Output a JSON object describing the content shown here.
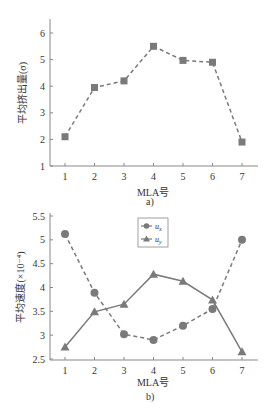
{
  "chart_data": [
    {
      "id": "a",
      "type": "line",
      "title": "",
      "caption": "a)",
      "xlabel": "MLA号",
      "ylabel": "平均挤出量(σ)",
      "categories": [
        "1",
        "2",
        "3",
        "4",
        "5",
        "6",
        "7"
      ],
      "x": [
        1,
        2,
        3,
        4,
        5,
        6,
        7
      ],
      "series": [
        {
          "name": "平均挤出量",
          "values": [
            2.1,
            3.95,
            4.2,
            5.5,
            4.97,
            4.9,
            1.9
          ],
          "marker": "square",
          "line": "dashed",
          "color": "#7a7a7a"
        }
      ],
      "ylim": [
        1,
        6.5
      ],
      "yticks": [
        1,
        2,
        3,
        4,
        5,
        6
      ],
      "ytick_labels": [
        "1",
        "2",
        "3",
        "4",
        "5",
        "6"
      ],
      "grid": false,
      "legend": null
    },
    {
      "id": "b",
      "type": "line",
      "title": "",
      "caption": "b)",
      "xlabel": "MLA号",
      "ylabel": "平均速度(×10⁻⁴)",
      "categories": [
        "1",
        "2",
        "3",
        "4",
        "5",
        "6",
        "7"
      ],
      "x": [
        1,
        2,
        3,
        4,
        5,
        6,
        7
      ],
      "series": [
        {
          "name": "ux",
          "label_main": "u",
          "label_sub": "x",
          "values": [
            5.12,
            3.89,
            3.02,
            2.9,
            3.2,
            3.55,
            5.0
          ],
          "marker": "circle",
          "line": "dashed",
          "color": "#7a7a7a"
        },
        {
          "name": "uy",
          "label_main": "u",
          "label_sub": "y",
          "values": [
            2.75,
            3.49,
            3.65,
            4.28,
            4.13,
            3.74,
            2.65
          ],
          "marker": "triangle",
          "line": "solid",
          "color": "#7a7a7a"
        }
      ],
      "ylim": [
        2.5,
        5.5
      ],
      "yticks": [
        2.5,
        3,
        3.5,
        4,
        4.5,
        5,
        5.5
      ],
      "ytick_labels": [
        "2.5",
        "3",
        "3.5",
        "4",
        "4.5",
        "5",
        "5.5"
      ],
      "grid": false,
      "legend": {
        "position": "upper center",
        "entries": [
          "ux",
          "uy"
        ]
      }
    }
  ]
}
